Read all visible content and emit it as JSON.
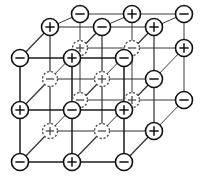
{
  "figure": {
    "width": 215,
    "height": 179,
    "background_color": "#ffffff",
    "line_color": "#111111",
    "hidden_line_color": "#4a4a4a"
  },
  "legend": {
    "positive_symbol": "+",
    "negative_symbol": "−",
    "solid_meaning": "visible front ion",
    "dashed_meaning": "hidden interior ion"
  },
  "lattice": {
    "dimensions": {
      "x": 3,
      "y": 3,
      "z": 3
    },
    "node_radius_solid": 8.5,
    "node_radius_dashed": 7.5,
    "spacing_x": 52,
    "spacing_y": 52,
    "depth_dx": 30,
    "depth_dy": -31,
    "origin": {
      "x": 20,
      "y": 162
    },
    "nodes": [
      {
        "id": "n000",
        "i": 0,
        "j": 0,
        "k": 0,
        "cx": 20,
        "cy": 162,
        "charge": "-",
        "style": "solid"
      },
      {
        "id": "n100",
        "i": 1,
        "j": 0,
        "k": 0,
        "cx": 72,
        "cy": 162,
        "charge": "+",
        "style": "solid"
      },
      {
        "id": "n200",
        "i": 2,
        "j": 0,
        "k": 0,
        "cx": 124,
        "cy": 162,
        "charge": "-",
        "style": "solid"
      },
      {
        "id": "n010",
        "i": 0,
        "j": 1,
        "k": 0,
        "cx": 20,
        "cy": 110,
        "charge": "+",
        "style": "solid"
      },
      {
        "id": "n110",
        "i": 1,
        "j": 1,
        "k": 0,
        "cx": 72,
        "cy": 110,
        "charge": "-",
        "style": "solid"
      },
      {
        "id": "n210",
        "i": 2,
        "j": 1,
        "k": 0,
        "cx": 124,
        "cy": 110,
        "charge": "+",
        "style": "solid"
      },
      {
        "id": "n020",
        "i": 0,
        "j": 2,
        "k": 0,
        "cx": 20,
        "cy": 58,
        "charge": "-",
        "style": "solid"
      },
      {
        "id": "n120",
        "i": 1,
        "j": 2,
        "k": 0,
        "cx": 72,
        "cy": 58,
        "charge": "+",
        "style": "solid"
      },
      {
        "id": "n220",
        "i": 2,
        "j": 2,
        "k": 0,
        "cx": 124,
        "cy": 58,
        "charge": "-",
        "style": "solid"
      },
      {
        "id": "n001",
        "i": 0,
        "j": 0,
        "k": 1,
        "cx": 50,
        "cy": 131,
        "charge": "+",
        "style": "dashed"
      },
      {
        "id": "n101",
        "i": 1,
        "j": 0,
        "k": 1,
        "cx": 102,
        "cy": 131,
        "charge": "-",
        "style": "dashed"
      },
      {
        "id": "n201",
        "i": 2,
        "j": 0,
        "k": 1,
        "cx": 154,
        "cy": 131,
        "charge": "+",
        "style": "solid"
      },
      {
        "id": "n011",
        "i": 0,
        "j": 1,
        "k": 1,
        "cx": 50,
        "cy": 79,
        "charge": "-",
        "style": "dashed"
      },
      {
        "id": "n111",
        "i": 1,
        "j": 1,
        "k": 1,
        "cx": 102,
        "cy": 79,
        "charge": "+",
        "style": "dashed"
      },
      {
        "id": "n211",
        "i": 2,
        "j": 1,
        "k": 1,
        "cx": 154,
        "cy": 79,
        "charge": "-",
        "style": "solid"
      },
      {
        "id": "n021",
        "i": 0,
        "j": 2,
        "k": 1,
        "cx": 50,
        "cy": 27,
        "charge": "+",
        "style": "solid"
      },
      {
        "id": "n121",
        "i": 1,
        "j": 2,
        "k": 1,
        "cx": 102,
        "cy": 27,
        "charge": "-",
        "style": "solid"
      },
      {
        "id": "n221",
        "i": 2,
        "j": 2,
        "k": 1,
        "cx": 154,
        "cy": 27,
        "charge": "+",
        "style": "solid"
      },
      {
        "id": "n002",
        "i": 0,
        "j": 0,
        "k": 2,
        "cx": 80,
        "cy": 100,
        "charge": "-",
        "style": "dashed"
      },
      {
        "id": "n102",
        "i": 1,
        "j": 0,
        "k": 2,
        "cx": 132,
        "cy": 100,
        "charge": "+",
        "style": "dashed"
      },
      {
        "id": "n202",
        "i": 2,
        "j": 0,
        "k": 2,
        "cx": 184,
        "cy": 100,
        "charge": "-",
        "style": "solid"
      },
      {
        "id": "n012",
        "i": 0,
        "j": 1,
        "k": 2,
        "cx": 80,
        "cy": 48,
        "charge": "+",
        "style": "dashed"
      },
      {
        "id": "n112",
        "i": 1,
        "j": 1,
        "k": 2,
        "cx": 132,
        "cy": 48,
        "charge": "-",
        "style": "dashed"
      },
      {
        "id": "n212",
        "i": 2,
        "j": 1,
        "k": 2,
        "cx": 184,
        "cy": 48,
        "charge": "+",
        "style": "solid"
      },
      {
        "id": "n022",
        "i": 0,
        "j": 2,
        "k": 2,
        "cx": 80,
        "cy": 14,
        "charge": "-",
        "style": "solid"
      },
      {
        "id": "n122",
        "i": 1,
        "j": 2,
        "k": 2,
        "cx": 132,
        "cy": 14,
        "charge": "+",
        "style": "solid"
      },
      {
        "id": "n222",
        "i": 2,
        "j": 2,
        "k": 2,
        "cx": 184,
        "cy": 14,
        "charge": "-",
        "style": "solid"
      }
    ]
  }
}
